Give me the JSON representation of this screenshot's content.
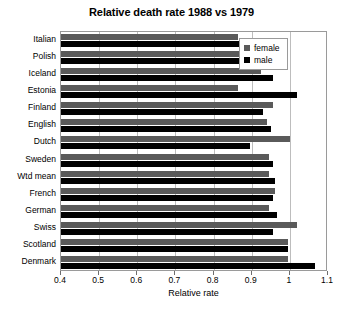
{
  "chart_data": {
    "type": "bar",
    "orientation": "horizontal",
    "title": "Relative death rate 1988 vs 1979",
    "xlabel": "Relative rate",
    "ylabel": "",
    "xlim": [
      0.4,
      1.1
    ],
    "xticks": [
      0.4,
      0.5,
      0.6,
      0.7,
      0.8,
      0.9,
      1,
      1.1
    ],
    "xtick_labels": [
      "0.4",
      "0.5",
      "0.6",
      "0.7",
      "0.8",
      "0.9",
      "1",
      "1.1"
    ],
    "grid": "vertical",
    "legend_position": "top-right",
    "categories": [
      "Italian",
      "Polish",
      "Iceland",
      "Estonia",
      "Finland",
      "English",
      "Dutch",
      "Sweden",
      "Wtd mean",
      "French",
      "German",
      "Swiss",
      "Scotland",
      "Denmark"
    ],
    "series": [
      {
        "name": "female",
        "color": "#5a5a5a",
        "values": [
          0.865,
          0.91,
          0.925,
          0.865,
          0.955,
          0.94,
          1.0,
          0.945,
          0.945,
          0.96,
          0.945,
          1.02,
          0.995,
          0.995
        ]
      },
      {
        "name": "male",
        "color": "#000000",
        "values": [
          0.885,
          0.925,
          0.955,
          1.02,
          0.93,
          0.95,
          0.895,
          0.955,
          0.96,
          0.955,
          0.965,
          0.955,
          0.995,
          1.065
        ]
      }
    ]
  },
  "legend": {
    "items": [
      {
        "label": "female",
        "marker": "square-gray"
      },
      {
        "label": "male",
        "marker": "square-black"
      }
    ]
  }
}
